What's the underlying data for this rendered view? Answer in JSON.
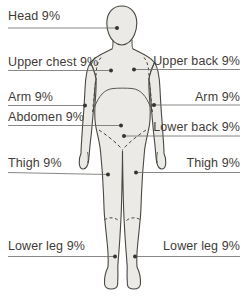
{
  "diagram": {
    "figure": "human-body-front-outline",
    "labels": [
      {
        "id": "head",
        "text": "Head 9%",
        "side": "left"
      },
      {
        "id": "upper-chest",
        "text": "Upper chest 9%",
        "side": "left"
      },
      {
        "id": "upper-back",
        "text": "Upper back 9%",
        "side": "right"
      },
      {
        "id": "arm-left",
        "text": "Arm 9%",
        "side": "left"
      },
      {
        "id": "arm-right",
        "text": "Arm 9%",
        "side": "right"
      },
      {
        "id": "abdomen",
        "text": "Abdomen 9%",
        "side": "left"
      },
      {
        "id": "lower-back",
        "text": "Lower back 9%",
        "side": "right"
      },
      {
        "id": "thigh-left",
        "text": "Thigh 9%",
        "side": "left"
      },
      {
        "id": "thigh-right",
        "text": "Thigh 9%",
        "side": "right"
      },
      {
        "id": "lower-leg-left",
        "text": "Lower leg 9%",
        "side": "left"
      },
      {
        "id": "lower-leg-right",
        "text": "Lower leg 9%",
        "side": "right"
      }
    ],
    "colors": {
      "background": "#ffffff",
      "body_fill": "#ebeae7",
      "body_outline": "#4a4741",
      "callout_line": "#6b6966",
      "callout_dot": "#36342f",
      "label_text": "#3f3c38"
    }
  }
}
